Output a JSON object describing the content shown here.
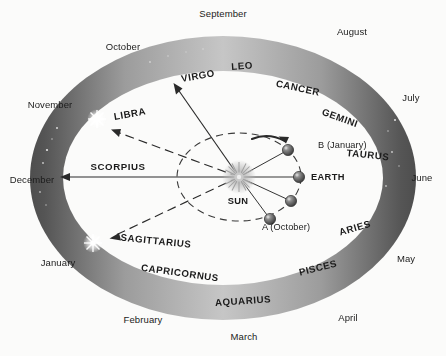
{
  "diagram": {
    "background_color": "#fbfbfa",
    "ring": {
      "name": "zodiac-band",
      "light_color": "#c9c9c9",
      "dark_color": "#4a4a4a",
      "mid_color": "#8d8d8d"
    },
    "center": {
      "sun_label": "SUN",
      "color": "#9a9a9a"
    },
    "months": [
      {
        "name": "September",
        "x": 223,
        "y": 14
      },
      {
        "name": "August",
        "x": 352,
        "y": 32
      },
      {
        "name": "July",
        "x": 411,
        "y": 98
      },
      {
        "name": "June",
        "x": 422,
        "y": 178
      },
      {
        "name": "May",
        "x": 406,
        "y": 259
      },
      {
        "name": "April",
        "x": 348,
        "y": 318
      },
      {
        "name": "March",
        "x": 244,
        "y": 337
      },
      {
        "name": "February",
        "x": 143,
        "y": 320
      },
      {
        "name": "January",
        "x": 58,
        "y": 263
      },
      {
        "name": "December",
        "x": 32,
        "y": 180
      },
      {
        "name": "November",
        "x": 50,
        "y": 105
      },
      {
        "name": "October",
        "x": 123,
        "y": 47
      }
    ],
    "constellations": [
      {
        "name": "LEO",
        "x": 242,
        "y": 66,
        "rot": -4
      },
      {
        "name": "VIRGO",
        "x": 198,
        "y": 76,
        "rot": -10
      },
      {
        "name": "CANCER",
        "x": 298,
        "y": 88,
        "rot": 12
      },
      {
        "name": "GEMINI",
        "x": 340,
        "y": 118,
        "rot": 20
      },
      {
        "name": "TAURUS",
        "x": 368,
        "y": 155,
        "rot": 6
      },
      {
        "name": "ARIES",
        "x": 355,
        "y": 228,
        "rot": -16
      },
      {
        "name": "PISCES",
        "x": 318,
        "y": 268,
        "rot": -14
      },
      {
        "name": "AQUARIUS",
        "x": 243,
        "y": 301,
        "rot": -4
      },
      {
        "name": "CAPRICORNUS",
        "x": 180,
        "y": 273,
        "rot": 8
      },
      {
        "name": "SAGITTARIUS",
        "x": 156,
        "y": 241,
        "rot": 6
      },
      {
        "name": "SCORPIUS",
        "x": 118,
        "y": 167,
        "rot": 0
      },
      {
        "name": "LIBRA",
        "x": 130,
        "y": 114,
        "rot": -10
      }
    ],
    "earth_positions": [
      {
        "label": "B (January)",
        "label_x": 318,
        "label_y": 146,
        "cx": 288,
        "cy": 150
      },
      {
        "label": "EARTH",
        "label_x": 329,
        "label_y": 178,
        "cx": 299,
        "cy": 177
      },
      {
        "label": "",
        "label_x": 0,
        "label_y": 0,
        "cx": 291,
        "cy": 201
      },
      {
        "label": "A (October)",
        "label_x": 295,
        "label_y": 226,
        "cx": 270,
        "cy": 219
      }
    ],
    "sun": {
      "label": "SUN",
      "label_x": 238,
      "label_y": 202,
      "cx": 239,
      "cy": 177
    },
    "sightlines": [
      {
        "to": "VIRGO",
        "style": "solid",
        "tip_x": 174,
        "tip_y": 85
      },
      {
        "to": "LIBRA",
        "style": "dashed",
        "tip_x": 112,
        "tip_y": 129
      },
      {
        "to": "SCORPIUS",
        "style": "solid",
        "tip_x": 62,
        "tip_y": 177
      },
      {
        "to": "SAGITTARIUS",
        "style": "dashed",
        "tip_x": 110,
        "tip_y": 238
      }
    ],
    "orbit": {
      "rx": 62,
      "ry": 44,
      "style": "dashed",
      "direction": "counterclockwise"
    }
  }
}
